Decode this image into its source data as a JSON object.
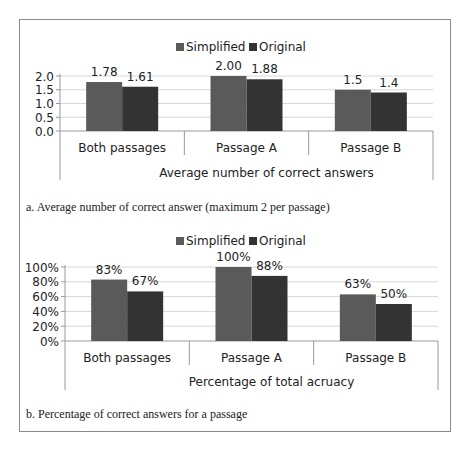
{
  "colors": {
    "simplified": "#5a5a5a",
    "original": "#333333",
    "grid": "#d8d8d8",
    "axis": "#999999",
    "frame": "#8a8a8a"
  },
  "legend": {
    "simplified": "Simplified",
    "original": "Original"
  },
  "captions": {
    "a": "a.  Average number of correct answer (maximum 2 per passage)",
    "b": "b.  Percentage of correct answers for a passage"
  },
  "chart_data": [
    {
      "type": "bar",
      "title": "",
      "xlabel": "Average number of correct answers",
      "ylabel": "",
      "categories": [
        "Both passages",
        "Passage A",
        "Passage B"
      ],
      "series": [
        {
          "name": "Simplified",
          "values": [
            1.78,
            2.0,
            1.5
          ],
          "labels": [
            "1.78",
            "2.00",
            "1.5"
          ]
        },
        {
          "name": "Original",
          "values": [
            1.61,
            1.88,
            1.4
          ],
          "labels": [
            "1.61",
            "1.88",
            "1.4"
          ]
        }
      ],
      "yticks": [
        "0.0",
        "0.5",
        "1.0",
        "1.5",
        "2.0"
      ],
      "ylim": [
        0,
        2.0
      ],
      "grid": true,
      "legend_position": "top"
    },
    {
      "type": "bar",
      "title": "",
      "xlabel": "Percentage of total acruacy",
      "ylabel": "",
      "categories": [
        "Both passages",
        "Passage A",
        "Passage B"
      ],
      "series": [
        {
          "name": "Simplified",
          "values": [
            83,
            100,
            63
          ],
          "labels": [
            "83%",
            "100%",
            "63%"
          ]
        },
        {
          "name": "Original",
          "values": [
            67,
            88,
            50
          ],
          "labels": [
            "67%",
            "88%",
            "50%"
          ]
        }
      ],
      "yticks": [
        "0%",
        "20%",
        "40%",
        "60%",
        "80%",
        "100%"
      ],
      "ylim": [
        0,
        100
      ],
      "grid": true,
      "legend_position": "top"
    }
  ]
}
